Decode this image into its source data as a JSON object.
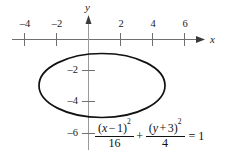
{
  "figure": {
    "type": "conic-section-graph",
    "axes": {
      "x_axis_label": "x",
      "y_axis_label": "y",
      "x_ticks": [
        {
          "value": -4,
          "label": "–4"
        },
        {
          "value": -2,
          "label": "–2"
        },
        {
          "value": 2,
          "label": "2"
        },
        {
          "value": 4,
          "label": "4"
        },
        {
          "value": 6,
          "label": "6"
        }
      ],
      "y_ticks": [
        {
          "value": -2,
          "label": "–2"
        },
        {
          "value": -4,
          "label": "–4"
        },
        {
          "value": -6,
          "label": "–6"
        }
      ],
      "x_range": [
        -5.5,
        7.0
      ],
      "y_range": [
        -7.0,
        1.0
      ],
      "axis_color": "#6f6f6f",
      "arrow_heads": [
        "x-positive",
        "y-positive"
      ]
    },
    "curve": {
      "shape": "ellipse",
      "center": [
        1,
        -3
      ],
      "semi_axis_a": 4,
      "semi_axis_b": 2,
      "major_axis": "horizontal",
      "stroke_color": "#111111",
      "stroke_width": 1.6,
      "fill": "none"
    }
  },
  "equation": {
    "numerator_1_open": "(",
    "numerator_1_var": "x",
    "numerator_1_op": "−",
    "numerator_1_const": "1",
    "numerator_1_close": ")",
    "numerator_1_exp": "2",
    "denominator_1": "16",
    "plus": "+",
    "numerator_2_open": "(",
    "numerator_2_var": "y",
    "numerator_2_op": "+",
    "numerator_2_const": "3",
    "numerator_2_close": ")",
    "numerator_2_exp": "2",
    "denominator_2": "4",
    "equals": "=",
    "result": "1",
    "plain_text": "(x−1)²/16 + (y+3)²/4 = 1"
  }
}
